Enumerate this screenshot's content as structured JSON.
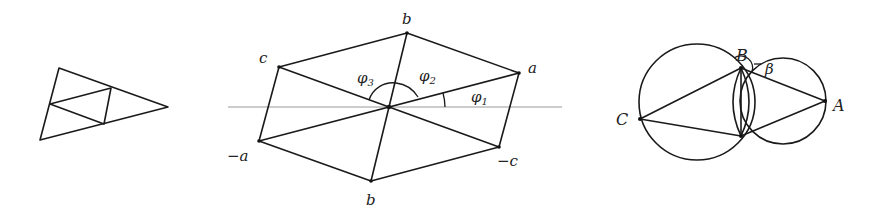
{
  "figure": {
    "panels": [
      {
        "id": "subdivided-triangle",
        "description": "Triangle subdivided into four smaller triangles by joining edge midpoints"
      },
      {
        "id": "hexagon-angles",
        "labels": {
          "b_top": "b",
          "a": "a",
          "neg_c": "−c",
          "b_bottom": "b",
          "neg_a": "−a",
          "c": "c",
          "phi1": "φ",
          "phi1_sub": "1",
          "phi2": "φ",
          "phi2_sub": "2",
          "phi3": "φ",
          "phi3_sub": "3"
        }
      },
      {
        "id": "intersecting-circles",
        "labels": {
          "A": "A",
          "B": "B",
          "C": "C",
          "beta": "β"
        }
      }
    ]
  }
}
